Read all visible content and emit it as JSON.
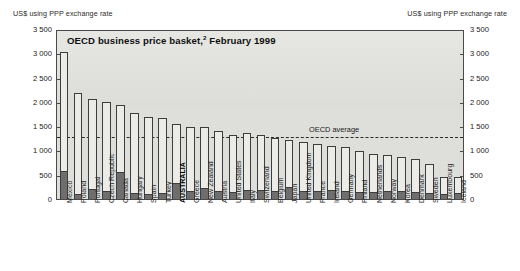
{
  "axis_caption_left": "US$ using PPP exchange rate",
  "axis_caption_right": "US$ using PPP exchange rate",
  "title_main": "OECD business price basket,",
  "title_footnote": "2",
  "title_date": " February 1999",
  "oecd_average_label": "OECD average",
  "colors": {
    "bar_upper": "#ebebe7",
    "bar_lower": "#6e6e6e",
    "plot_background": "#dededa",
    "frame": "#4a4a4a",
    "average_line": "#2a2a2a"
  },
  "chart_data": {
    "type": "bar",
    "title": "OECD business price basket,2 February 1999",
    "subtitle": "",
    "xlabel": "",
    "ylabel": "US$ using PPP exchange rate",
    "ylim": [
      0,
      3500
    ],
    "ytick_labels": [
      "0",
      "500",
      "1 000",
      "1 500",
      "2 000",
      "2 500",
      "3 000",
      "3 500"
    ],
    "ytick_values": [
      0,
      500,
      1000,
      1500,
      2000,
      2500,
      3000,
      3500
    ],
    "grid": false,
    "legend_position": "none",
    "stacked": true,
    "annotations": [
      {
        "label": "OECD average",
        "type": "hline",
        "value": 1300
      }
    ],
    "categories": [
      "Mexico",
      "Poland",
      "Portugal",
      "Czech Republic",
      "Canada",
      "Hungary",
      "Spain",
      "Turkey",
      "AUSTRALIA",
      "Greece",
      "New Zealand",
      "Austria",
      "United States",
      "Italy",
      "Switzerland",
      "Belgium",
      "Japan",
      "United Kingdom",
      "France",
      "Ireland",
      "Germany",
      "Finland",
      "Netherlands",
      "Norway",
      "Korea",
      "Denmark",
      "Sweden",
      "Luxembourg",
      "Iceland"
    ],
    "highlight_category": "AUSTRALIA",
    "series": [
      {
        "name": "Lower component",
        "values": [
          570,
          110,
          210,
          155,
          550,
          120,
          105,
          130,
          330,
          175,
          230,
          170,
          140,
          190,
          185,
          175,
          255,
          160,
          165,
          195,
          160,
          150,
          145,
          155,
          160,
          150,
          125,
          110,
          120
        ]
      },
      {
        "name": "Upper component",
        "values": [
          2450,
          2070,
          1840,
          1845,
          1380,
          1650,
          1575,
          1545,
          1210,
          1305,
          1245,
          1230,
          1180,
          1160,
          1125,
          1090,
          950,
          1015,
          970,
          890,
          905,
          840,
          775,
          755,
          700,
          680,
          595,
          350,
          335
        ]
      }
    ],
    "totals": [
      3020,
      2180,
      2050,
      2000,
      1930,
      1770,
      1680,
      1675,
      1540,
      1480,
      1475,
      1400,
      1320,
      1350,
      1310,
      1265,
      1205,
      1175,
      1135,
      1085,
      1065,
      990,
      920,
      910,
      860,
      830,
      720,
      460,
      455
    ]
  }
}
